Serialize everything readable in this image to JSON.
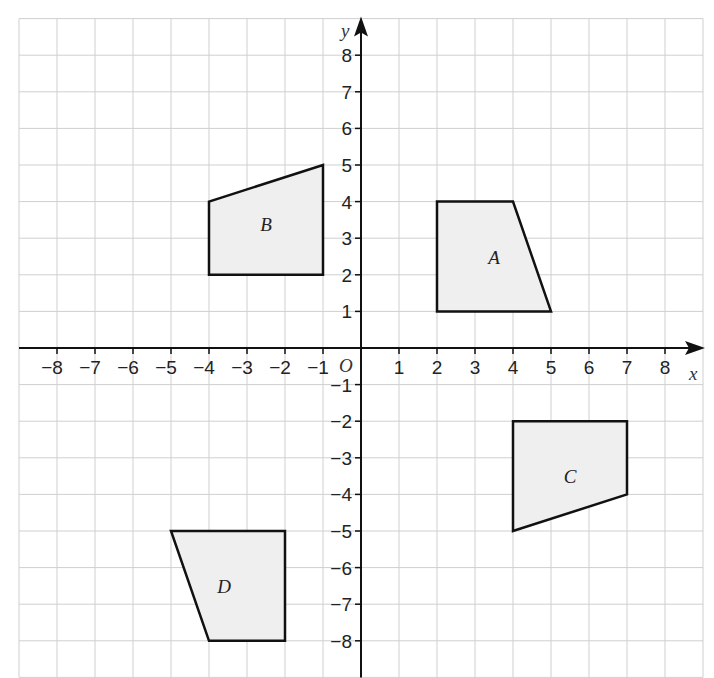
{
  "diagram": {
    "x_axis": {
      "label": "x",
      "min": -9,
      "max": 9,
      "tick_labels": [
        "-8",
        "-7",
        "-6",
        "-5",
        "-4",
        "-3",
        "-2",
        "-1",
        "1",
        "2",
        "3",
        "4",
        "5",
        "6",
        "7",
        "8"
      ]
    },
    "y_axis": {
      "label": "y",
      "min": -9,
      "max": 9,
      "tick_labels": [
        "8",
        "7",
        "6",
        "5",
        "4",
        "3",
        "2",
        "1",
        "-1",
        "-2",
        "-3",
        "-4",
        "-5",
        "-6",
        "-7",
        "-8"
      ]
    },
    "origin_label": "O",
    "colors": {
      "grid": "#cfcfcf",
      "axis": "#111111",
      "shape_fill": "#efefef",
      "shape_stroke": "#111111"
    },
    "shapes": [
      {
        "label": "A",
        "vertices": [
          [
            2,
            1
          ],
          [
            2,
            4
          ],
          [
            4,
            4
          ],
          [
            5,
            1
          ]
        ],
        "label_pos": [
          3.5,
          2.5
        ]
      },
      {
        "label": "B",
        "vertices": [
          [
            -4,
            2
          ],
          [
            -4,
            4
          ],
          [
            -1,
            5
          ],
          [
            -1,
            2
          ]
        ],
        "label_pos": [
          -2.5,
          3.4
        ]
      },
      {
        "label": "C",
        "vertices": [
          [
            4,
            -2
          ],
          [
            7,
            -2
          ],
          [
            7,
            -4
          ],
          [
            4,
            -5
          ]
        ],
        "label_pos": [
          5.5,
          -3.5
        ]
      },
      {
        "label": "D",
        "vertices": [
          [
            -5,
            -5
          ],
          [
            -2,
            -5
          ],
          [
            -2,
            -8
          ],
          [
            -4,
            -8
          ]
        ],
        "label_pos": [
          -3.6,
          -6.5
        ]
      }
    ]
  }
}
